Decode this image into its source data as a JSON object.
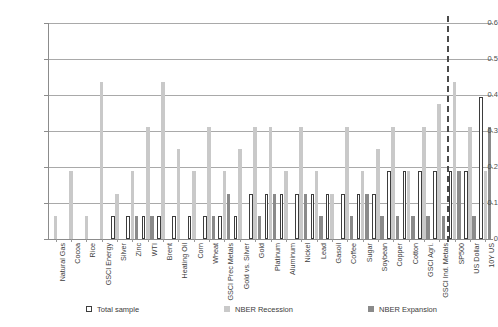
{
  "chart_data": {
    "type": "bar",
    "title": "",
    "subtitle": "",
    "xlabel": "",
    "ylabel": "",
    "ylim": [
      0,
      0.6
    ],
    "yticks": [
      "0",
      "0.1",
      "0.2",
      "0.3",
      "0.4",
      "0.5",
      "0.6"
    ],
    "ytick_values": [
      0,
      0.1,
      0.2,
      0.3,
      0.4,
      0.5,
      0.6
    ],
    "grid": true,
    "legend_position": "bottom",
    "separator_after_category": "GSCI Ind. Metals",
    "categories": [
      "Natural Gas",
      "Cocoa",
      "Rice",
      "GSCI Energy",
      "Silver",
      "Zinc",
      "WTI",
      "Brent",
      "Heating Oil",
      "Corn",
      "Wheat",
      "GSCI Prec Metals",
      "Gold vs. Silver",
      "Gold",
      "Platinum",
      "Aluminum",
      "Nickel",
      "Lead",
      "Gasoil",
      "Coffee",
      "Sugar",
      "Soybean",
      "Copper",
      "Cotton",
      "GSCI Agri.",
      "GSCI Ind. Metals",
      "SP500",
      "US Dollar",
      "10Y US"
    ],
    "series": [
      {
        "name": "Total sample",
        "color": "#ffffff",
        "edge_color": "#3d3d3d",
        "values": [
          0,
          0,
          0,
          0,
          0.063,
          0.063,
          0.063,
          0.063,
          0.063,
          0.063,
          0.063,
          0.063,
          0.063,
          0.125,
          0.125,
          0.125,
          0.125,
          0.125,
          0.125,
          0.125,
          0.125,
          0.125,
          0.188,
          0.188,
          0.188,
          0.188,
          0.188,
          0.188,
          0.395
        ]
      },
      {
        "name": "NBER Recession",
        "color": "#c9c9c9",
        "values": [
          0.063,
          0.188,
          0.063,
          0.435,
          0.125,
          0.188,
          0.31,
          0.435,
          0.25,
          0.188,
          0.31,
          0.188,
          0.25,
          0.31,
          0.31,
          0.188,
          0.31,
          0.188,
          0.125,
          0.31,
          0.188,
          0.25,
          0.31,
          0.188,
          0.31,
          0.375,
          0.437,
          0.31,
          0.188
        ]
      },
      {
        "name": "NBER Expansion",
        "color": "#8a8a8a",
        "values": [
          0,
          0,
          0,
          0,
          0,
          0.063,
          0.063,
          0,
          0,
          0,
          0.063,
          0.125,
          0,
          0.063,
          0.125,
          0,
          0.125,
          0.063,
          0,
          0.063,
          0.125,
          0.063,
          0.063,
          0.063,
          0.063,
          0.063,
          0.188,
          0.063,
          0.31
        ]
      }
    ],
    "legend": [
      {
        "label": "Total sample",
        "swatch": "total"
      },
      {
        "label": "NBER Recession",
        "swatch": "recession"
      },
      {
        "label": "NBER Expansion",
        "swatch": "expansion"
      }
    ]
  }
}
